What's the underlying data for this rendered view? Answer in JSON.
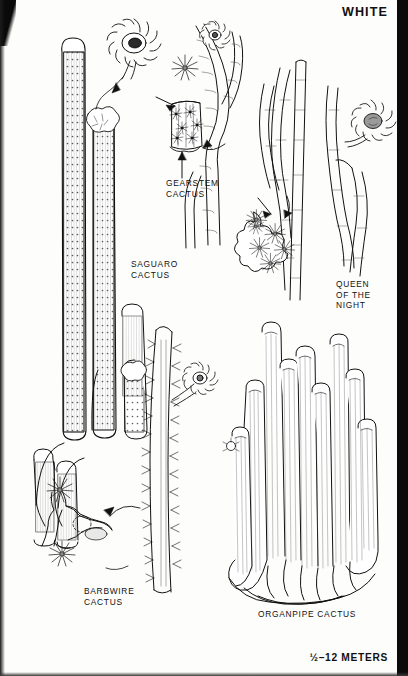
{
  "page": {
    "header": "WHITE",
    "scale_note": "½–12 METERS",
    "background_color": "#fdfdfb",
    "ink_color": "#111111",
    "scan_edge_color": "#0a0a0a"
  },
  "labels": {
    "gearstem": "GEARSTEM\nCACTUS",
    "saguaro": "SAGUARO\nCACTUS",
    "queen_of_the_night": "QUEEN\nOF THE\nNIGHT",
    "barbwire": "BARBWIRE\nCACTUS",
    "organpipe": "ORGANPIPE CACTUS"
  },
  "illustrations": [
    {
      "name": "saguaro-cactus",
      "label": "SAGUARO CACTUS",
      "description": "Tall ribbed columnar cactus with several upswept arms, dotted areole rows, and an enlarged white flower detail at upper left connected by a leader line."
    },
    {
      "name": "gearstem-cactus",
      "label": "GEARSTEM CACTUS",
      "description": "Slender jointed stems with a magnified ribbed stem segment detail and a radiating spine cluster, marked by two arrows."
    },
    {
      "name": "queen-of-the-night-cactus",
      "label": "QUEEN OF THE NIGHT",
      "description": "Sprawling thin ribbed stems with a large white star-shaped flower at right and a magnified wavy stem cross-section with spine clusters at lower left."
    },
    {
      "name": "barbwire-cactus",
      "label": "BARBWIRE CACTUS",
      "description": "Long spiny ribbed stem bearing a white flower, with a magnified jointed stem detail showing large radiating spine clusters at lower left."
    },
    {
      "name": "organpipe-cactus",
      "label": "ORGANPIPE CACTUS",
      "description": "Clump of many tall finely-lined vertical stems rising from a common base."
    }
  ]
}
